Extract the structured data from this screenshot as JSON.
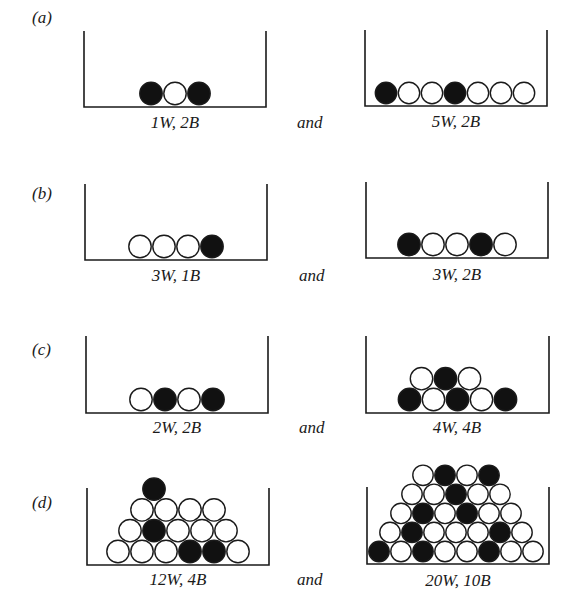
{
  "figure": {
    "ball_colors": {
      "W": "#ffffff",
      "B": "#111111",
      "stroke": "#1a1a1a"
    },
    "rows": [
      {
        "label": "(a)",
        "connector": "and",
        "left": {
          "caption": "1W, 2B",
          "layers": [
            [
              "B",
              "W",
              "B"
            ]
          ]
        },
        "right": {
          "caption": "5W, 2B",
          "layers": [
            [
              "B",
              "W",
              "W",
              "B",
              "W",
              "W",
              "W"
            ]
          ]
        }
      },
      {
        "label": "(b)",
        "connector": "and",
        "left": {
          "caption": "3W, 1B",
          "layers": [
            [
              "W",
              "W",
              "W",
              "B"
            ]
          ]
        },
        "right": {
          "caption": "3W, 2B",
          "layers": [
            [
              "B",
              "W",
              "W",
              "B",
              "W"
            ]
          ]
        }
      },
      {
        "label": "(c)",
        "connector": "and",
        "left": {
          "caption": "2W, 2B",
          "layers": [
            [
              "W",
              "B",
              "W",
              "B"
            ]
          ]
        },
        "right": {
          "caption": "4W, 4B",
          "layers": [
            [
              "B",
              "W",
              "B",
              "W",
              "B"
            ],
            [
              "W",
              "B",
              "W"
            ]
          ]
        }
      },
      {
        "label": "(d)",
        "connector": "and",
        "left": {
          "caption": "12W, 4B",
          "layers": [
            [
              "W",
              "W",
              "W",
              "B",
              "B",
              "W"
            ],
            [
              "W",
              "B",
              "W",
              "W",
              "W"
            ],
            [
              "W",
              "W",
              "W",
              "W"
            ],
            [
              "B"
            ]
          ]
        },
        "right": {
          "caption": "20W, 10B",
          "layers": [
            [
              "B",
              "W",
              "B",
              "W",
              "W",
              "B",
              "W",
              "W"
            ],
            [
              "W",
              "B",
              "W",
              "W",
              "W",
              "B",
              "W"
            ],
            [
              "W",
              "B",
              "W",
              "B",
              "W",
              "W"
            ],
            [
              "W",
              "W",
              "B",
              "W",
              "W"
            ],
            [
              "W",
              "B",
              "W",
              "B"
            ]
          ]
        }
      }
    ]
  }
}
